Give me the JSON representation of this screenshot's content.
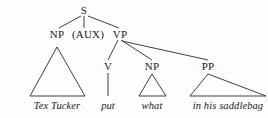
{
  "figure": {
    "type": "syntax-tree",
    "caption": "",
    "width": 268,
    "height": 118,
    "background_color": "#fdfdfd",
    "line_color": "#2b2b2b",
    "text_color": "#1a1a1a"
  },
  "nodes": {
    "s": {
      "label": "S",
      "x": 84,
      "y": 10
    },
    "np_subject": {
      "label": "NP",
      "x": 57,
      "y": 34
    },
    "aux": {
      "label": "(AUX)",
      "x": 88,
      "y": 34
    },
    "vp": {
      "label": "VP",
      "x": 120,
      "y": 34
    },
    "v": {
      "label": "V",
      "x": 108,
      "y": 66
    },
    "np_object": {
      "label": "NP",
      "x": 152,
      "y": 66
    },
    "pp": {
      "label": "PP",
      "x": 208,
      "y": 66
    }
  },
  "terminals": {
    "subject": {
      "text": "Tex Tucker",
      "x": 57,
      "y": 106
    },
    "verb": {
      "text": "put",
      "x": 108,
      "y": 106
    },
    "object": {
      "text": "what",
      "x": 152,
      "y": 106
    },
    "prepositional_phrase": {
      "text": "in his saddlebag",
      "x": 228,
      "y": 106
    }
  },
  "sentence": "Tex Tucker put what in his saddlebag"
}
